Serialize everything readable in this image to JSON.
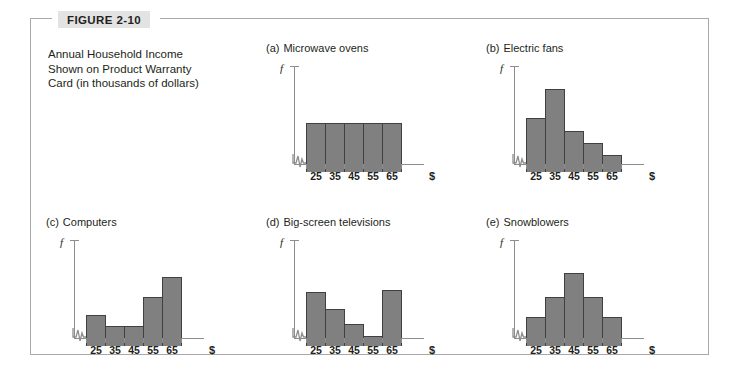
{
  "figure": {
    "badge_label": "FIGURE 2-10",
    "caption_lines": [
      "Annual Household Income",
      "Shown on Product Warranty",
      "Card (in thousands of dollars)"
    ],
    "frame_color": "#a9a9ab",
    "badge_bg": "#e3e3e3"
  },
  "axes": {
    "y_label": "f",
    "x_unit_label": "$",
    "tick_labels": [
      "25",
      "35",
      "45",
      "55",
      "65"
    ],
    "axis_color": "#8d8d8f",
    "bar_fill": "#808080",
    "bar_stroke": "#404040"
  },
  "chart_data": [
    {
      "type": "bar",
      "panel": "(a)",
      "title": "Microwave ovens",
      "categories": [
        "25",
        "35",
        "45",
        "55",
        "65"
      ],
      "values": [
        50,
        50,
        50,
        50,
        50
      ],
      "xlabel": "$",
      "ylabel": "f",
      "ylim": [
        0,
        100
      ],
      "grid": false,
      "legend": "none",
      "shape": "uniform"
    },
    {
      "type": "bar",
      "panel": "(b)",
      "title": "Electric fans",
      "categories": [
        "25",
        "35",
        "45",
        "55",
        "65"
      ],
      "values": [
        55,
        85,
        42,
        30,
        17
      ],
      "xlabel": "$",
      "ylabel": "f",
      "ylim": [
        0,
        100
      ],
      "grid": false,
      "legend": "none",
      "shape": "skewed-right"
    },
    {
      "type": "bar",
      "panel": "(c)",
      "title": "Computers",
      "categories": [
        "25",
        "35",
        "45",
        "55",
        "65"
      ],
      "values": [
        32,
        20,
        20,
        50,
        70
      ],
      "xlabel": "$",
      "ylabel": "f",
      "ylim": [
        0,
        100
      ],
      "grid": false,
      "legend": "none",
      "shape": "skewed-left"
    },
    {
      "type": "bar",
      "panel": "(d)",
      "title": "Big-screen televisions",
      "categories": [
        "25",
        "35",
        "45",
        "55",
        "65"
      ],
      "values": [
        55,
        38,
        22,
        10,
        57
      ],
      "xlabel": "$",
      "ylabel": "f",
      "ylim": [
        0,
        100
      ],
      "grid": false,
      "legend": "none",
      "shape": "bimodal"
    },
    {
      "type": "bar",
      "panel": "(e)",
      "title": "Snowblowers",
      "categories": [
        "25",
        "35",
        "45",
        "55",
        "65"
      ],
      "values": [
        30,
        50,
        75,
        50,
        30
      ],
      "xlabel": "$",
      "ylabel": "f",
      "ylim": [
        0,
        100
      ],
      "grid": false,
      "legend": "none",
      "shape": "symmetric"
    }
  ]
}
